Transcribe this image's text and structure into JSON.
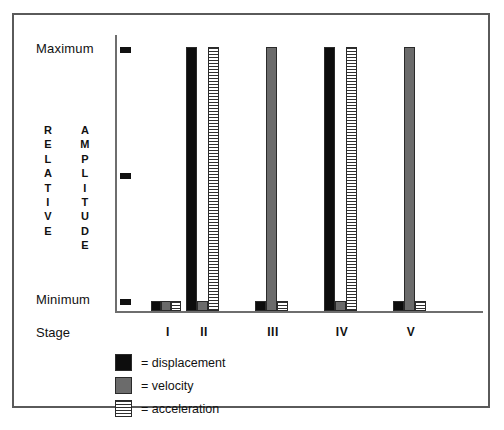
{
  "chart_data": {
    "type": "bar",
    "title": "",
    "xlabel": "Stage",
    "ylabel": "RELATIVE AMPLITUDE",
    "categories": [
      "I",
      "II",
      "III",
      "IV",
      "V"
    ],
    "ytick_labels": [
      "Maximum",
      "Minimum"
    ],
    "yaxis_levels": [
      "Maximum",
      "Middle",
      "Minimum"
    ],
    "ylim": [
      0,
      100
    ],
    "grid": false,
    "legend_position": "below-left",
    "series": [
      {
        "name": "displacement",
        "color": "#0d0d0d",
        "values": [
          4,
          100,
          4,
          100,
          4
        ],
        "levels": [
          "Minimum",
          "Maximum",
          "Minimum",
          "Maximum",
          "Minimum"
        ]
      },
      {
        "name": "velocity",
        "color": "#6b6b6b",
        "values": [
          4,
          4,
          100,
          4,
          100
        ],
        "levels": [
          "Minimum",
          "Minimum",
          "Maximum",
          "Minimum",
          "Maximum"
        ]
      },
      {
        "name": "acceleration",
        "color": "#ffffff-striped",
        "values": [
          4,
          100,
          4,
          100,
          4
        ],
        "levels": [
          "Minimum",
          "Maximum",
          "Minimum",
          "Maximum",
          "Minimum"
        ]
      }
    ],
    "annotations": [
      "Stage I: all three series at Minimum",
      "Stage II: displacement and acceleration at Maximum, velocity at Minimum",
      "Stage III: velocity at Maximum, displacement and acceleration at Minimum",
      "Stage IV: displacement and acceleration at Maximum, velocity at Minimum",
      "Stage V: velocity at Maximum, displacement and acceleration at Minimum"
    ]
  },
  "axis": {
    "max_label": "Maximum",
    "min_label": "Minimum",
    "title_line1": "RELATIVE",
    "title_line2": "AMPLITUDE",
    "stage_label": "Stage"
  },
  "legend": {
    "items": [
      {
        "swatch": "displacement-swatch",
        "label": "= displacement"
      },
      {
        "swatch": "velocity-swatch",
        "label": "= velocity"
      },
      {
        "swatch": "acceleration-swatch",
        "label": "= acceleration"
      }
    ]
  }
}
